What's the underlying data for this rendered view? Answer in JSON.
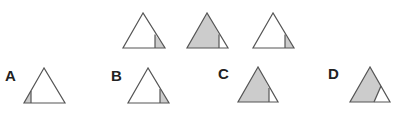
{
  "colors": {
    "stroke": "#555555",
    "fill_shaded": "#cccccc",
    "fill_blank": "#ffffff"
  },
  "sequence": {
    "description": "Three triangles in a sequence; shaded region grows/changes",
    "items": [
      {
        "id": "seq-1",
        "shaded_part": "small right corner"
      },
      {
        "id": "seq-2",
        "shaded_part": "large left part"
      },
      {
        "id": "seq-3",
        "shaded_part": "small right corner"
      }
    ]
  },
  "options": [
    {
      "label": "A",
      "shaded_part": "small left corner"
    },
    {
      "label": "B",
      "shaded_part": "small right corner"
    },
    {
      "label": "C",
      "shaded_part": "large left part"
    },
    {
      "label": "D",
      "shaded_part": "large part, slanted divider"
    }
  ]
}
